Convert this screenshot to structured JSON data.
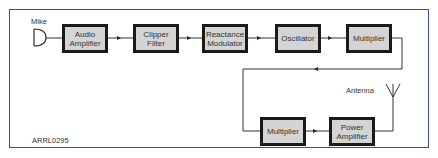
{
  "diagram": {
    "type": "block-diagram",
    "title": "",
    "figure_id": "ARRL0295",
    "input_label": "Mike",
    "output_label": "Antenna",
    "blocks": [
      {
        "id": "audio-amplifier",
        "label": "Audio\nAmplifier"
      },
      {
        "id": "clipper-filter",
        "label": "Clipper\nFilter"
      },
      {
        "id": "reactance-modulator",
        "label": "Reactance\nModulator"
      },
      {
        "id": "oscillator",
        "label": "Oscillator"
      },
      {
        "id": "multiplier-1",
        "label": "Multiplier"
      },
      {
        "id": "multiplier-2",
        "label": "Multiplier"
      },
      {
        "id": "power-amplifier",
        "label": "Power\nAmplifier"
      }
    ],
    "connections": [
      [
        "Mike",
        "Audio Amplifier"
      ],
      [
        "Audio Amplifier",
        "Clipper Filter"
      ],
      [
        "Clipper Filter",
        "Reactance Modulator"
      ],
      [
        "Reactance Modulator",
        "Oscillator"
      ],
      [
        "Oscillator",
        "Multiplier"
      ],
      [
        "Multiplier",
        "Multiplier"
      ],
      [
        "Multiplier",
        "Power Amplifier"
      ],
      [
        "Power Amplifier",
        "Antenna"
      ]
    ],
    "colors": {
      "frame_border": "#3b47a3",
      "block_fill": "#d4d4d4",
      "block_border": "#1a1a1a",
      "wire": "#333333",
      "text": "#333333"
    }
  }
}
